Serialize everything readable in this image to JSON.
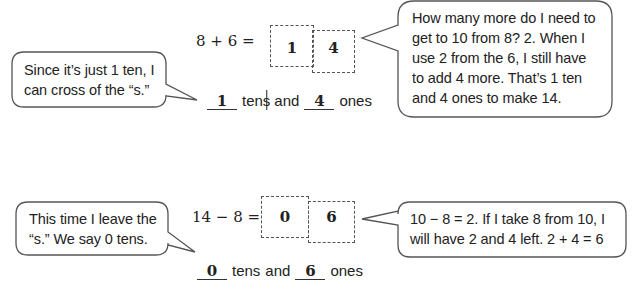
{
  "problem1": {
    "equation": "8 + 6 =",
    "tens_digit": "1",
    "ones_digit": "4",
    "sentence": {
      "tens_value": "1",
      "tens_word_base": "ten",
      "tens_word_crossed": "s",
      "and": "and",
      "ones_value": "4",
      "ones_word": "ones"
    },
    "left_callout": {
      "line1": "Since it’s just 1 ten, I",
      "line2": "can cross of the “s.”"
    },
    "right_callout": {
      "line1": "How many more do I need to",
      "line2": "get to 10 from 8?  2.  When I",
      "line3": "use 2 from the 6, I still have",
      "line4": "to add 4 more.  That’s 1 ten",
      "line5": "and 4 ones to make 14."
    }
  },
  "problem2": {
    "equation": "14 − 8 =",
    "tens_digit": "0",
    "ones_digit": "6",
    "sentence": {
      "tens_value": "0",
      "tens_word": "tens",
      "and": "and",
      "ones_value": "6",
      "ones_word": "ones"
    },
    "left_callout": {
      "line1": "This time I leave the",
      "line2": "“s.”  We say 0 tens."
    },
    "right_callout": {
      "line1": "10 − 8 = 2.  If I take 8 from 10, I",
      "line2": "will have 2 and 4 left.  2 + 4 = 6"
    }
  }
}
